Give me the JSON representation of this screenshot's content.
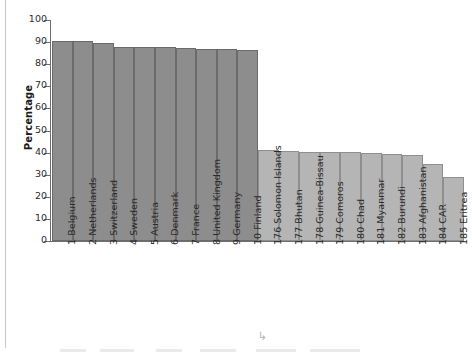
{
  "chart_data": {
    "type": "bar",
    "title": "",
    "xlabel": "",
    "ylabel": "Percentage",
    "ylim": [
      0,
      100
    ],
    "ytick_labels": [
      "100",
      "90",
      "80",
      "70",
      "60",
      "50",
      "40",
      "30",
      "20",
      "10",
      "0"
    ],
    "yticks": [
      100,
      90,
      80,
      70,
      60,
      50,
      40,
      30,
      20,
      10,
      0
    ],
    "grid": false,
    "legend": false,
    "categories": [
      "1 Belgium",
      "2 Netherlands",
      "3 Switzerland",
      "4 Sweden",
      "5 Austria",
      "6 Denmark",
      "7 France",
      "8 United Kingdom",
      "9 Germany",
      "10 Finland",
      "176 Solomon Islands",
      "177 Bhutan",
      "178 Guinea-Bissau",
      "179 Comoros",
      "180 Chad",
      "181 Myanmar",
      "182 Burundi",
      "183 Afghanistan",
      "184 CAR",
      "185 Eritrea"
    ],
    "values": [
      90.5,
      90.3,
      89.8,
      88.0,
      87.8,
      87.7,
      87.4,
      87.0,
      87.0,
      86.4,
      41.0,
      40.7,
      40.3,
      40.2,
      40.2,
      39.8,
      39.3,
      38.7,
      34.8,
      28.8
    ],
    "groups": [
      "top",
      "top",
      "top",
      "top",
      "top",
      "top",
      "top",
      "top",
      "top",
      "top",
      "bottom",
      "bottom",
      "bottom",
      "bottom",
      "bottom",
      "bottom",
      "bottom",
      "bottom",
      "bottom",
      "bottom"
    ],
    "colors": {
      "top": "#8d8d8d",
      "bottom": "#b5b5b5",
      "bar_edge": "#6d6d6d",
      "axis": "#6f6f6f",
      "text": "#2b2b2b"
    }
  }
}
